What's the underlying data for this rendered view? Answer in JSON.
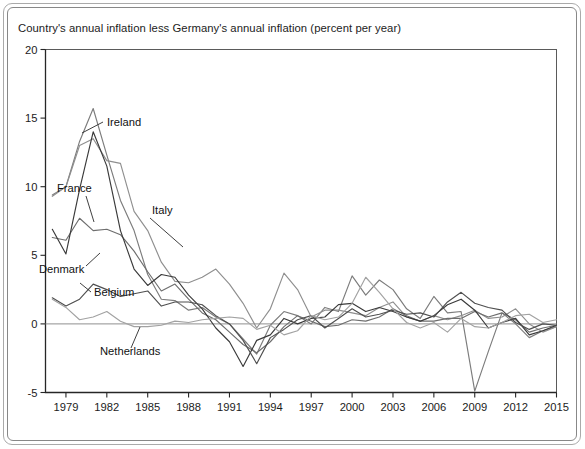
{
  "figure": {
    "title": "Country's annual inflation less Germany's annual inflation (percent per year)"
  },
  "chart_data": {
    "type": "line",
    "title": "Country's annual inflation less Germany's annual inflation (percent per year)",
    "xlabel": "",
    "ylabel": "percent per year",
    "xlim": [
      1977.5,
      2015
    ],
    "ylim": [
      -5,
      20
    ],
    "ytick_values": [
      -5,
      0,
      5,
      10,
      15,
      20
    ],
    "ytick_labels": [
      "-5",
      "0",
      "5",
      "10",
      "15",
      "20"
    ],
    "xtick_values": [
      1979,
      1982,
      1985,
      1988,
      1991,
      1994,
      1997,
      2000,
      2003,
      2006,
      2009,
      2012,
      2015
    ],
    "xtick_labels": [
      "1979",
      "1982",
      "1985",
      "1988",
      "1991",
      "1994",
      "1997",
      "2000",
      "2003",
      "2006",
      "2009",
      "2012",
      "2015"
    ],
    "grid": false,
    "legend_position": "inline-annotations",
    "zero_reference_line": 0,
    "annotations": [
      {
        "label": "Ireland",
        "x": 1984.0,
        "y": 13.3,
        "leader_to_x": 1982.1,
        "leader_to_y": 12.2
      },
      {
        "label": "France",
        "x": 1979.6,
        "y": 8.5,
        "leader_to_x": 1980.6,
        "leader_to_y": 6.4
      },
      {
        "label": "Italy",
        "x": 1986.5,
        "y": 6.6,
        "leader_to_x": 1988.6,
        "leader_to_y": 4.6
      },
      {
        "label": "Denmark",
        "x": 1978.3,
        "y": 3.6,
        "leader_to_x": 1980.2,
        "leader_to_y": 5.1
      },
      {
        "label": "Belgium",
        "x": 1982.4,
        "y": 2.3,
        "leader_to_x": 1981.2,
        "leader_to_y": 2.9
      },
      {
        "label": "Netherlands",
        "x": 1982.0,
        "y": -2.6,
        "leader_to_x": 1983.6,
        "leader_to_y": -0.5
      }
    ],
    "x": [
      1978,
      1979,
      1980,
      1981,
      1982,
      1983,
      1984,
      1985,
      1986,
      1987,
      1988,
      1989,
      1990,
      1991,
      1992,
      1993,
      1994,
      1995,
      1996,
      1997,
      1998,
      1999,
      2000,
      2001,
      2002,
      2003,
      2004,
      2005,
      2006,
      2007,
      2008,
      2009,
      2010,
      2011,
      2012,
      2013,
      2014,
      2015
    ],
    "series": [
      {
        "name": "Ireland",
        "color": "#7c7c7c",
        "values": [
          9.4,
          10.0,
          13.3,
          15.7,
          12.3,
          9.0,
          6.8,
          3.6,
          1.8,
          1.7,
          1.0,
          1.2,
          0.5,
          0.0,
          -1.1,
          -2.2,
          -0.1,
          0.9,
          0.6,
          0.0,
          1.2,
          0.9,
          3.5,
          2.1,
          3.2,
          2.5,
          1.1,
          0.4,
          2.0,
          0.8,
          0.9,
          -4.9,
          -2.0,
          0.8,
          0.0,
          -1.0,
          -0.5,
          -0.2
        ]
      },
      {
        "name": "Italy",
        "color": "#8f8f8f",
        "values": [
          9.3,
          10.0,
          13.0,
          13.5,
          11.9,
          11.7,
          8.2,
          6.8,
          4.5,
          3.1,
          3.0,
          3.4,
          4.0,
          2.9,
          1.5,
          -0.3,
          1.1,
          3.7,
          2.5,
          0.5,
          1.0,
          1.0,
          0.8,
          0.6,
          1.2,
          1.6,
          0.5,
          0.2,
          0.6,
          0.3,
          0.6,
          1.0,
          0.4,
          0.5,
          1.1,
          0.0,
          -0.6,
          -0.2
        ]
      },
      {
        "name": "France",
        "color": "#6e6e6e",
        "values": [
          6.3,
          6.1,
          7.7,
          6.8,
          6.9,
          6.5,
          5.3,
          3.8,
          2.4,
          2.9,
          1.8,
          0.8,
          0.3,
          -0.6,
          -1.5,
          -2.1,
          -1.3,
          -0.2,
          0.6,
          0.2,
          -0.2,
          -0.1,
          0.3,
          0.2,
          0.5,
          1.1,
          0.6,
          0.2,
          0.2,
          0.4,
          0.4,
          0.9,
          0.5,
          0.8,
          0.3,
          -0.6,
          -0.3,
          -0.1
        ]
      },
      {
        "name": "Denmark",
        "color": "#3a3a3a",
        "values": [
          6.9,
          5.1,
          9.8,
          14.0,
          11.5,
          6.8,
          4.0,
          2.8,
          3.6,
          3.4,
          2.1,
          1.1,
          -0.3,
          -1.3,
          -3.1,
          -1.2,
          -0.8,
          0.4,
          0.0,
          0.4,
          0.5,
          1.4,
          1.5,
          0.9,
          1.2,
          0.9,
          0.5,
          0.2,
          0.6,
          1.4,
          1.8,
          1.0,
          -0.3,
          0.1,
          0.4,
          -0.8,
          -0.5,
          -0.1
        ]
      },
      {
        "name": "Belgium",
        "color": "#4f4f4f",
        "values": [
          1.9,
          1.3,
          1.8,
          2.9,
          2.5,
          2.0,
          2.2,
          2.4,
          1.3,
          1.6,
          1.6,
          1.4,
          0.6,
          0.0,
          -1.2,
          -2.9,
          -1.0,
          -0.4,
          0.3,
          0.6,
          -0.3,
          0.4,
          1.1,
          0.5,
          0.7,
          1.0,
          0.7,
          0.8,
          0.5,
          1.6,
          2.3,
          1.5,
          1.2,
          1.0,
          0.1,
          -0.4,
          0.0,
          -0.1
        ]
      },
      {
        "name": "Netherlands",
        "color": "#a2a2a2",
        "values": [
          1.8,
          1.2,
          0.3,
          0.5,
          0.9,
          0.2,
          -0.2,
          -0.2,
          -0.1,
          0.2,
          0.1,
          0.3,
          0.4,
          0.5,
          0.4,
          -0.4,
          -0.1,
          -0.8,
          -0.5,
          0.6,
          0.3,
          0.5,
          1.5,
          3.4,
          2.3,
          1.1,
          0.1,
          -0.3,
          0.1,
          -0.6,
          0.4,
          -0.2,
          -0.3,
          0.1,
          0.6,
          0.7,
          0.1,
          0.3
        ]
      }
    ]
  }
}
